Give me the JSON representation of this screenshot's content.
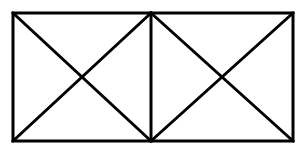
{
  "diagram": {
    "type": "geometric-figure",
    "stroke_color": "#000000",
    "background_color": "#ffffff",
    "stroke_width": 3,
    "outer_rect": {
      "x1": 13,
      "y1": 13,
      "x2": 293,
      "y2": 141
    },
    "divider_x": 151,
    "cells": [
      {
        "name": "left-square",
        "x1": 13,
        "y1": 13,
        "x2": 151,
        "y2": 141
      },
      {
        "name": "right-square",
        "x1": 151,
        "y1": 13,
        "x2": 293,
        "y2": 141
      }
    ]
  }
}
